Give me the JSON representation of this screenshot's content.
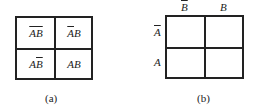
{
  "figure_a": {
    "caption": "(a)",
    "cells": [
      {
        "label": "A̅B̅",
        "a_bar": true,
        "b_bar": true
      },
      {
        "label": "A̅B",
        "a_bar": true,
        "b_bar": false
      },
      {
        "label": "AB̅",
        "a_bar": false,
        "b_bar": true
      },
      {
        "label": "AB",
        "a_bar": false,
        "b_bar": false
      }
    ]
  },
  "figure_b": {
    "caption": "(b)",
    "column_headers": [
      "B̅",
      "B"
    ],
    "row_headers": [
      "A̅",
      "A"
    ]
  }
}
